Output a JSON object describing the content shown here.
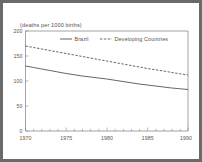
{
  "figure": {
    "background_color": "#ffffff",
    "outer_border_color": "#6a6a6a",
    "axis_color": "#7d7d7d",
    "line_color": "#4a4a4a"
  },
  "chart_data": {
    "type": "line",
    "title": "",
    "subtitle": "",
    "unit_label": "(deaths per 1000 births)",
    "xlabel": "",
    "ylabel": "",
    "xlim": [
      1970,
      1990
    ],
    "ylim": [
      0,
      200
    ],
    "x_ticks": [
      1970,
      1975,
      1980,
      1985,
      1990
    ],
    "x_tick_labels": [
      "1970",
      "1975",
      "1980",
      "1985",
      "1990"
    ],
    "y_ticks": [
      0,
      50,
      100,
      150,
      200
    ],
    "y_tick_labels": [
      "0",
      "50",
      "100",
      "150",
      "200"
    ],
    "minor_x_ticks": true,
    "grid": false,
    "legend_position": "top-center",
    "x": [
      1970,
      1971,
      1972,
      1973,
      1974,
      1975,
      1976,
      1977,
      1978,
      1979,
      1980,
      1981,
      1982,
      1983,
      1984,
      1985,
      1986,
      1987,
      1988,
      1989,
      1990
    ],
    "series": [
      {
        "name": "Brazil",
        "style": "solid",
        "values": [
          130,
          127,
          124,
          121,
          118,
          115,
          112.5,
          110,
          108,
          106,
          104,
          101.5,
          99,
          96.5,
          94,
          92,
          90,
          88,
          86,
          84.5,
          83
        ]
      },
      {
        "name": "Developing Countries",
        "style": "dashed",
        "values": [
          170,
          167,
          164,
          161,
          158,
          155,
          152,
          149,
          146,
          143,
          140,
          137,
          134,
          131,
          128,
          125,
          122.5,
          120,
          117,
          114.5,
          112
        ]
      }
    ]
  },
  "legend": {
    "entries": [
      {
        "label": "Brazil",
        "style": "solid"
      },
      {
        "label": "Developing Countries",
        "style": "dashed"
      }
    ]
  }
}
